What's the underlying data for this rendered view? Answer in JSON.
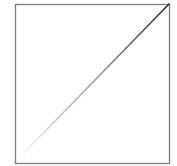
{
  "diagram": {
    "frame": {
      "x": 15,
      "y": 4,
      "width": 154,
      "height": 159,
      "stroke": "#7a7a7a",
      "stroke_width": 1.3
    },
    "diagonal": {
      "x1": 24,
      "y1": 153,
      "x2": 169,
      "y2": 4,
      "color_start": "#f2f2f2",
      "color_mid": "#9a9a9a",
      "color_end": "#2a2a2a",
      "stroke_width": 1.6
    }
  }
}
